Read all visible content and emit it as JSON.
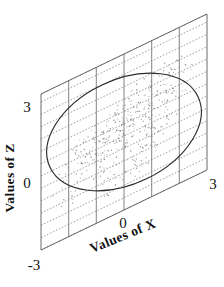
{
  "figure": {
    "kind": "scatterplot-3d-plane",
    "background": "#ffffff",
    "ink_color": "#2b2b2b"
  },
  "axes": {
    "x_axis": {
      "title": "Values of X",
      "ticks": [
        "-3",
        "0",
        "3"
      ],
      "tick_values": [
        -3,
        0,
        3
      ],
      "range": [
        -3,
        3
      ]
    },
    "z_axis": {
      "title": "Values of Z",
      "ticks": [
        "0",
        "3"
      ],
      "tick_values": [
        0,
        3
      ],
      "range": [
        -3,
        3
      ]
    }
  },
  "labels": {
    "z_tick_3": "3",
    "z_tick_0": "0",
    "x_tick_neg3": "-3",
    "x_tick_0": "0",
    "x_tick_3": "3",
    "x_title": "Values of X",
    "z_title": "Values of Z"
  },
  "chart_data": {
    "type": "scatter",
    "title": "",
    "subtitle": "",
    "xlabel": "Values of X",
    "ylabel": "Values of Z",
    "xlim": [
      -3,
      3
    ],
    "ylim": [
      -3,
      3
    ],
    "grid": true,
    "legend": null,
    "projection": "oblique-parallelogram",
    "grid_lines": {
      "vertical_count": 7,
      "slanted_count": 7,
      "vertical_at": [
        -3,
        -2,
        -1,
        0,
        1,
        2,
        3
      ],
      "slanted_at": [
        -3,
        -2,
        -1,
        0,
        1,
        2,
        3
      ]
    },
    "annotations": [
      {
        "type": "ellipse",
        "role": "concentration-contour",
        "center": [
          0,
          0
        ],
        "semi_major": 3.05,
        "semi_minor": 1.95,
        "rotation_deg": 35,
        "stroke": "#2b2b2b"
      }
    ],
    "series": [
      {
        "name": "sample",
        "marker": "dot",
        "color": "#7b7b7b",
        "n_points": 430,
        "correlation": 0.68,
        "x": [
          -2.31,
          -1.02,
          0.44,
          1.66,
          -0.57,
          0.93,
          -1.48,
          2.05,
          0.12,
          -0.78,
          1.21,
          -2.02,
          0.67,
          1.84,
          -1.15,
          0.35,
          -0.21,
          1.42,
          -1.73,
          0.88,
          2.27,
          -0.44,
          1.07,
          -1.29,
          0.56,
          -0.05,
          1.95,
          -2.18,
          0.73,
          1.31,
          -0.92,
          0.18,
          -1.61,
          2.12,
          0.41,
          -0.36,
          1.55,
          -1.08,
          0.82,
          -2.05,
          1.13,
          0.27,
          -0.69,
          1.77,
          -1.37,
          0.61,
          2.33,
          -0.13,
          1.26,
          -1.86
        ],
        "y": [
          -1.84,
          -0.71,
          0.38,
          1.22,
          -0.22,
          0.64,
          -1.12,
          1.57,
          0.07,
          -0.49,
          0.86,
          -1.48,
          0.44,
          1.34,
          -0.78,
          0.21,
          -0.12,
          1.01,
          -1.26,
          0.59,
          1.71,
          -0.31,
          0.74,
          -0.93,
          0.37,
          -0.02,
          1.43,
          -1.62,
          0.51,
          0.95,
          -0.66,
          0.11,
          -1.18,
          1.55,
          0.28,
          -0.25,
          1.12,
          -0.77,
          0.55,
          -1.49,
          0.81,
          0.16,
          -0.48,
          1.29,
          -0.99,
          0.42,
          1.74,
          -0.09,
          0.9,
          -1.36
        ]
      }
    ]
  }
}
